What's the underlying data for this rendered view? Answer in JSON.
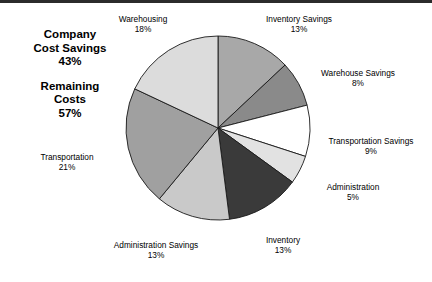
{
  "summary": {
    "savings_title_line1": "Company",
    "savings_title_line2": "Cost Savings",
    "savings_value": "43%",
    "remaining_title_line1": "Remaining",
    "remaining_title_line2": "Costs",
    "remaining_value": "57%"
  },
  "chart_data": {
    "type": "pie",
    "title": "",
    "start_angle_deg": 0,
    "direction": "clockwise",
    "legend": "labels-outside",
    "categories": [
      "Inventory Savings",
      "Warehouse Savings",
      "Transportation Savings",
      "Administration",
      "Inventory",
      "Administration Savings",
      "Transportation",
      "Warehousing"
    ],
    "values": [
      13,
      8,
      9,
      5,
      13,
      13,
      21,
      18
    ],
    "labels": [
      "13%",
      "8%",
      "9%",
      "5%",
      "13%",
      "13%",
      "21%",
      "18%"
    ],
    "colors": [
      "#a8a8a8",
      "#8a8a8a",
      "#ffffff",
      "#e2e2e2",
      "#3a3a3a",
      "#c9c9c9",
      "#a0a0a0",
      "#dcdcdc"
    ],
    "stroke": "#1a1a1a",
    "total": 100
  }
}
